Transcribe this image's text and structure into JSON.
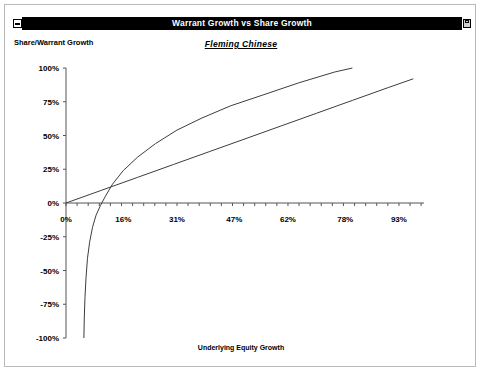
{
  "window": {
    "title": "Warrant Growth vs Share Growth",
    "sysmenu_icon": "window-system-menu-icon",
    "maximize_icon": "window-maximize-icon"
  },
  "chart_data": {
    "type": "line",
    "title": "Warrant Growth vs Share Growth",
    "subtitle": "Fleming Chinese",
    "ylabel": "Share/Warrant Growth",
    "xlabel": "Underlying Equity Growth",
    "grid": false,
    "legend": "none",
    "xlim": [
      -3,
      100
    ],
    "ylim": [
      -100,
      100
    ],
    "xticks": [
      "0%",
      "16%",
      "31%",
      "47%",
      "62%",
      "78%",
      "93%"
    ],
    "xtick_values": [
      0,
      16,
      31,
      47,
      62,
      78,
      93
    ],
    "yticks": [
      "100%",
      "75%",
      "50%",
      "25%",
      "0%",
      "-25%",
      "-50%",
      "-75%",
      "-100%"
    ],
    "ytick_values": [
      100,
      75,
      50,
      25,
      0,
      -25,
      -50,
      -75,
      -100
    ],
    "series": [
      {
        "name": "Share Growth",
        "x": [
          0,
          10,
          20,
          30,
          40,
          50,
          60,
          70,
          80,
          90,
          97
        ],
        "y": [
          0,
          9.5,
          19,
          28.5,
          38,
          47.5,
          57,
          66.5,
          76,
          85.5,
          92
        ]
      },
      {
        "name": "Warrant Growth",
        "x": [
          5.0,
          5.1,
          5.3,
          5.6,
          6.0,
          6.6,
          7.4,
          8.4,
          9.6,
          11.0,
          13.0,
          16.0,
          20.0,
          25.0,
          31.0,
          38.0,
          46.0,
          55.0,
          65.0,
          75.0,
          80.0
        ],
        "y": [
          -100,
          -86,
          -70,
          -55,
          -41,
          -29,
          -18,
          -9,
          -2,
          5,
          14,
          24,
          34,
          44,
          54,
          63,
          72,
          80,
          89,
          97,
          100
        ]
      }
    ]
  }
}
